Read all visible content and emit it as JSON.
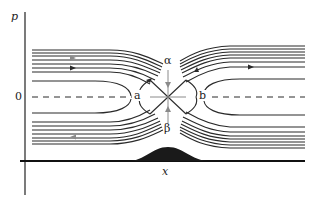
{
  "figure": {
    "y_axis_label": "p",
    "x_axis_label": "x",
    "origin_label": "0",
    "points": {
      "left_center": "a",
      "right_center": "b",
      "top_saddle_label": "α",
      "bottom_saddle_label": "β"
    },
    "colors": {
      "curve": "#2a2a2a",
      "arrow": "#8a8a8a",
      "bump_fill": "#1a1a1a"
    }
  }
}
